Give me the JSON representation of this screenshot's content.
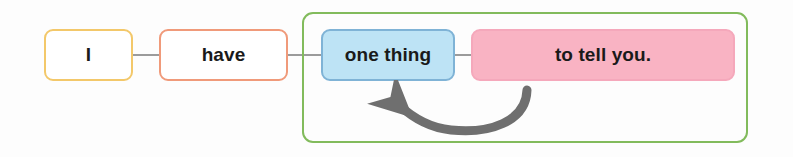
{
  "diagram": {
    "type": "sentence-structure-diagram",
    "sentence": "I have one thing to tell you.",
    "background_color": "#fdfdfd",
    "text_color": "#1a1a1a",
    "boxes": [
      {
        "id": "subject",
        "label": "I",
        "role": "subject",
        "border_color": "#f3c86a",
        "fill_color": "#ffffff"
      },
      {
        "id": "verb",
        "label": "have",
        "role": "verb",
        "border_color": "#f09a7a",
        "fill_color": "#ffffff"
      },
      {
        "id": "object",
        "label": "one thing",
        "role": "object",
        "border_color": "#7fb3d6",
        "fill_color": "#bde3f5"
      },
      {
        "id": "infinitive",
        "label": "to tell you.",
        "role": "infinitive-phrase",
        "border_color": "#f5a8bb",
        "fill_color": "#f9b3c3"
      }
    ],
    "group": {
      "id": "object-phrase-group",
      "border_color": "#82bb5c",
      "contains": [
        "object",
        "infinitive"
      ]
    },
    "arrow": {
      "id": "modifier-arrow",
      "color": "#6f6f6f",
      "direction": "right-to-left",
      "points_from": "to tell you.",
      "points_to": "one thing"
    },
    "connectors": {
      "color": "#9b9b9b",
      "count": 3
    }
  }
}
